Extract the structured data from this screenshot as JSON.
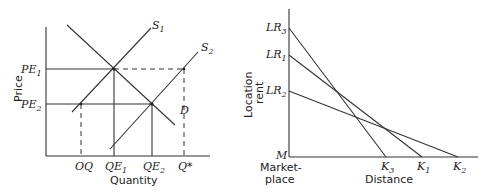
{
  "left_diagram": {
    "title": "Supply and demand with supply shift",
    "y_axis_label": "Price",
    "x_axis_label": "Quantity",
    "curves": {
      "demand": "D",
      "supply1": {
        "base": "S",
        "sub": "1"
      },
      "supply2": {
        "base": "S",
        "sub": "2"
      }
    },
    "y_ticks": [
      {
        "base": "PE",
        "sub": "1"
      },
      {
        "base": "PE",
        "sub": "2"
      }
    ],
    "x_ticks": [
      {
        "base": "OQ",
        "sub": ""
      },
      {
        "base": "QE",
        "sub": "1"
      },
      {
        "base": "QE",
        "sub": "2"
      },
      {
        "base": "Q*",
        "sub": ""
      }
    ]
  },
  "right_diagram": {
    "title": "Location rent vs distance",
    "y_axis_label_line1": "Location",
    "y_axis_label_line2": "rent",
    "x_axis_label": "Distance",
    "origin_label": "M",
    "origin_caption_line1": "Market-",
    "origin_caption_line2": "place",
    "y_ticks": [
      {
        "base": "LR",
        "sub": "3"
      },
      {
        "base": "LR",
        "sub": "1"
      },
      {
        "base": "LR",
        "sub": "2"
      }
    ],
    "x_ticks": [
      {
        "base": "K",
        "sub": "3"
      },
      {
        "base": "K",
        "sub": "1"
      },
      {
        "base": "K",
        "sub": "2"
      }
    ]
  }
}
